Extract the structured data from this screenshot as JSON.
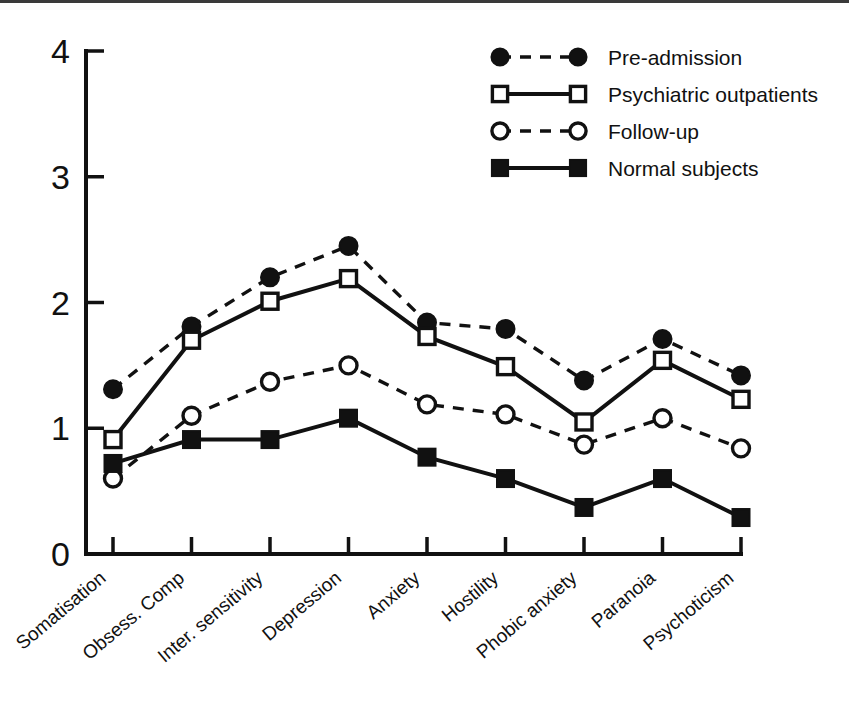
{
  "chart_data": {
    "type": "line",
    "title": "",
    "subtitle": "",
    "xlabel": "",
    "ylabel": "",
    "ylim": [
      0,
      4
    ],
    "yticks": [
      "0",
      "1",
      "2",
      "3",
      "4"
    ],
    "grid": false,
    "legend_position": "top-right",
    "categories": [
      "Somatisation",
      "Obsess. Comp",
      "Inter. sensitivity",
      "Depression",
      "Anxiety",
      "Hostility",
      "Phobic anxiety",
      "Paranoia",
      "Psychoticism"
    ],
    "series": [
      {
        "name": "Pre-admission",
        "marker": "filled-circle",
        "linestyle": "dashed",
        "color": "#111111",
        "values": [
          1.31,
          1.81,
          2.2,
          2.45,
          1.84,
          1.79,
          1.38,
          1.71,
          1.42
        ]
      },
      {
        "name": "Psychiatric outpatients",
        "marker": "open-square",
        "linestyle": "solid",
        "color": "#111111",
        "values": [
          0.91,
          1.7,
          2.01,
          2.19,
          1.73,
          1.49,
          1.05,
          1.54,
          1.23
        ]
      },
      {
        "name": "Follow-up",
        "marker": "open-circle",
        "linestyle": "dashed",
        "color": "#111111",
        "values": [
          0.6,
          1.1,
          1.37,
          1.5,
          1.19,
          1.11,
          0.87,
          1.08,
          0.84
        ]
      },
      {
        "name": "Normal subjects",
        "marker": "filled-square",
        "linestyle": "solid",
        "color": "#111111",
        "values": [
          0.72,
          0.91,
          0.91,
          1.08,
          0.77,
          0.6,
          0.37,
          0.6,
          0.29
        ]
      }
    ]
  },
  "legend": {
    "entries": [
      {
        "label": "Pre-admission"
      },
      {
        "label": "Psychiatric outpatients"
      },
      {
        "label": "Follow-up"
      },
      {
        "label": "Normal subjects"
      }
    ]
  }
}
